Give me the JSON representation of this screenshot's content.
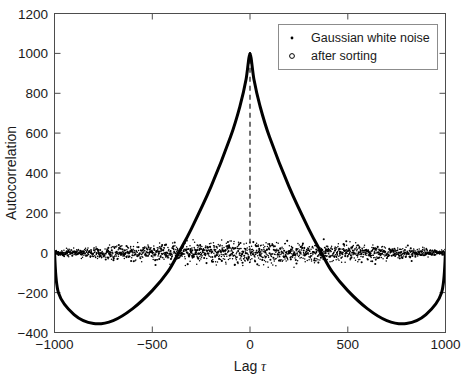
{
  "chart_data": {
    "type": "line",
    "title": "",
    "subtitle": "",
    "xlabel": "Lag",
    "xlabel_symbol": "τ",
    "ylabel": "Autocorrelation",
    "xlim": [
      -1000,
      1000
    ],
    "ylim": [
      -400,
      1200
    ],
    "xticks": [
      -1000,
      -500,
      0,
      500,
      1000
    ],
    "xtick_labels": [
      "−1000",
      "−500",
      "0",
      "500",
      "1000"
    ],
    "yticks": [
      -400,
      -200,
      0,
      200,
      400,
      600,
      800,
      1000,
      1200
    ],
    "ytick_labels": [
      "−400",
      "−200",
      "0",
      "200",
      "400",
      "600",
      "800",
      "1000",
      "1200"
    ],
    "grid": false,
    "legend_position": "top-right",
    "legend": [
      {
        "label": "Gaussian white noise",
        "marker": "filled-dot",
        "color": "#000000"
      },
      {
        "label": "after sorting",
        "marker": "open-circle",
        "color": "#000000"
      }
    ],
    "annotations": [
      {
        "type": "dashed-vertical-line",
        "x": 0,
        "y_from": 0,
        "y_to": 1000,
        "color": "#000000"
      }
    ],
    "series": [
      {
        "name": "Gaussian white noise",
        "type": "scatter",
        "marker": "filled-dot",
        "color": "#000000",
        "description": "dense noise band centred on zero, spread roughly ±60, N≈1800 points across the full lag range",
        "n_points": 1800,
        "mean": 0,
        "spread": 28,
        "max_spread": 75,
        "peak_x": 0,
        "peak_y": 1000
      },
      {
        "name": "after sorting",
        "type": "line",
        "marker": "open-circle",
        "color": "#000000",
        "line_width": 3,
        "description": "smooth symmetric autocorrelation of a sorted (ramp-like) sequence: sharp cusp of 1000 at lag 0, decaying concave limbs crossing zero near ±365, broad minima of about −355 near ±800, returning toward 0 at ±1000",
        "key_points": [
          {
            "x": -1000,
            "y": 0
          },
          {
            "x": -980,
            "y": -200
          },
          {
            "x": -900,
            "y": -310
          },
          {
            "x": -800,
            "y": -355
          },
          {
            "x": -700,
            "y": -340
          },
          {
            "x": -600,
            "y": -280
          },
          {
            "x": -500,
            "y": -190
          },
          {
            "x": -420,
            "y": -95
          },
          {
            "x": -365,
            "y": 0
          },
          {
            "x": -300,
            "y": 120
          },
          {
            "x": -200,
            "y": 330
          },
          {
            "x": -100,
            "y": 580
          },
          {
            "x": -50,
            "y": 740
          },
          {
            "x": -20,
            "y": 870
          },
          {
            "x": 0,
            "y": 1000
          },
          {
            "x": 20,
            "y": 870
          },
          {
            "x": 50,
            "y": 740
          },
          {
            "x": 100,
            "y": 580
          },
          {
            "x": 200,
            "y": 330
          },
          {
            "x": 300,
            "y": 120
          },
          {
            "x": 365,
            "y": 0
          },
          {
            "x": 420,
            "y": -95
          },
          {
            "x": 500,
            "y": -190
          },
          {
            "x": 600,
            "y": -280
          },
          {
            "x": 700,
            "y": -340
          },
          {
            "x": 800,
            "y": -355
          },
          {
            "x": 900,
            "y": -310
          },
          {
            "x": 980,
            "y": -200
          },
          {
            "x": 1000,
            "y": 0
          }
        ]
      }
    ]
  },
  "colors": {
    "background": "#ffffff",
    "axis": "#4d4d4d",
    "text": "#1a1a1a",
    "data": "#000000",
    "legend_border": "#8c8c8c"
  }
}
